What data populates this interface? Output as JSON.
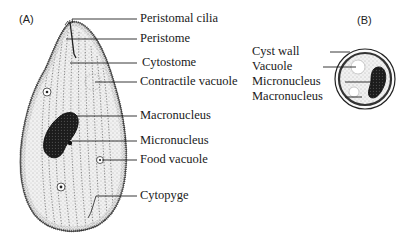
{
  "figure": {
    "panel_a": {
      "label": "(A)",
      "callouts": [
        {
          "text": "Peristomal cilia"
        },
        {
          "text": "Peristome"
        },
        {
          "text": "Cytostome"
        },
        {
          "text": "Contractile vacuole"
        },
        {
          "text": "Macronucleus"
        },
        {
          "text": "Micronucleus"
        },
        {
          "text": "Food vacuole"
        },
        {
          "text": "Cytopyge"
        }
      ]
    },
    "panel_b": {
      "label": "(B)",
      "callouts": [
        {
          "text": "Cyst wall"
        },
        {
          "text": "Vacuole"
        },
        {
          "text": "Micronucleus"
        },
        {
          "text": "Macronucleus"
        }
      ]
    }
  }
}
